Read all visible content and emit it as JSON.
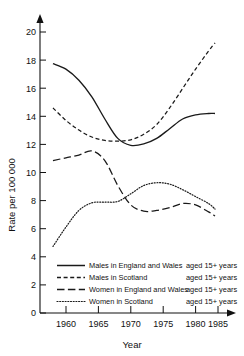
{
  "chart_data": {
    "type": "line",
    "title": "",
    "xlabel": "Year",
    "ylabel": "Rate per 100 000",
    "xlim": [
      1958,
      1987
    ],
    "ylim": [
      0,
      21
    ],
    "xticks": [
      1960,
      1965,
      1970,
      1975,
      1980,
      1985
    ],
    "yticks": [
      0,
      2,
      4,
      6,
      8,
      10,
      12,
      14,
      16,
      18,
      20
    ],
    "grid": false,
    "legend_position": "lower-center",
    "x": [
      1960,
      1962,
      1964,
      1966,
      1968,
      1970,
      1972,
      1974,
      1976,
      1978,
      1980,
      1982,
      1984,
      1985
    ],
    "series": [
      {
        "name": "Males in England and Wales",
        "note": "aged 15+ years",
        "style": "solid",
        "values": [
          18.0,
          17.6,
          16.8,
          15.6,
          14.0,
          12.6,
          12.1,
          12.2,
          12.6,
          13.3,
          14.0,
          14.3,
          14.4,
          14.4
        ]
      },
      {
        "name": "Males in Scotland",
        "note": "aged 15+ years",
        "style": "dashed",
        "values": [
          14.8,
          13.9,
          13.2,
          12.7,
          12.45,
          12.4,
          12.5,
          12.9,
          13.6,
          14.8,
          16.2,
          17.6,
          18.9,
          19.5
        ]
      },
      {
        "name": "Women  in England and Wales",
        "note": "aged 15+ years",
        "style": "long-dash",
        "values": [
          11.0,
          11.2,
          11.4,
          11.7,
          11.0,
          9.2,
          7.8,
          7.35,
          7.4,
          7.6,
          7.9,
          7.8,
          7.3,
          7.0
        ]
      },
      {
        "name": "Women in Scotland",
        "note": "aged 15+ years",
        "style": "dotted",
        "values": [
          4.8,
          6.2,
          7.4,
          7.95,
          8.0,
          8.05,
          8.6,
          9.2,
          9.4,
          9.3,
          8.9,
          8.4,
          7.9,
          7.5
        ]
      }
    ]
  },
  "axes": {
    "y_title": "Rate per 100 000",
    "x_title": "Year",
    "x_tick_labels": [
      "1960",
      "1965",
      "1970",
      "1975",
      "1980",
      "1985"
    ],
    "y_tick_labels": [
      "0",
      "2",
      "4",
      "6",
      "8",
      "10",
      "12",
      "14",
      "16",
      "18",
      "20"
    ]
  },
  "legend": {
    "items": [
      {
        "label": "Males in England and Wales",
        "note": "aged 15+ years"
      },
      {
        "label": "Males in Scotland",
        "note": "aged 15+ years"
      },
      {
        "label": "Women  in England and Wales",
        "note": "aged 15+ years"
      },
      {
        "label": "Women in Scotland",
        "note": "aged 15+ years"
      }
    ]
  },
  "colors": {
    "ink": "#1a1a1a",
    "background": "#ffffff"
  }
}
